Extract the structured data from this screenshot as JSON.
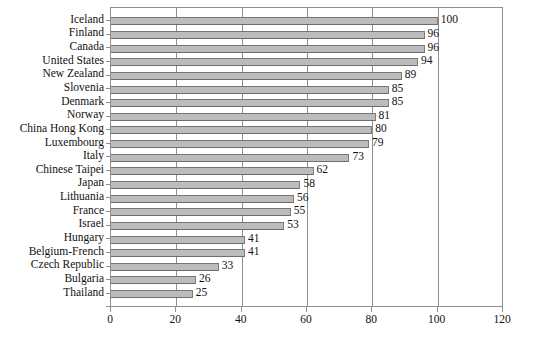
{
  "chart_data": {
    "type": "bar",
    "orientation": "horizontal",
    "title": "",
    "subtitle": "",
    "xlabel": "",
    "ylabel": "",
    "xlim": [
      0,
      120
    ],
    "xticks": [
      0,
      20,
      40,
      60,
      80,
      100,
      120
    ],
    "xtick_labels": [
      "0",
      "20",
      "40",
      "60",
      "80",
      "100",
      "120"
    ],
    "grid": "vertical",
    "legend": null,
    "bar_color": "#bcbcbc",
    "bar_edge_color": "#757575",
    "axis_color": "#8f8f8f",
    "categories": [
      "Iceland",
      "Finland",
      "Canada",
      "United States",
      "New Zealand",
      "Slovenia",
      "Denmark",
      "Norway",
      "China Hong Kong",
      "Luxembourg",
      "Italy",
      "Chinese Taipei",
      "Japan",
      "Lithuania",
      "France",
      "Israel",
      "Hungary",
      "Belgium-French",
      "Czech Republic",
      "Bulgaria",
      "Thailand"
    ],
    "values": [
      100,
      96,
      96,
      94,
      89,
      85,
      85,
      81,
      80,
      79,
      73,
      62,
      58,
      56,
      55,
      53,
      41,
      41,
      33,
      26,
      25
    ],
    "value_labels": [
      "100",
      "96",
      "96",
      "94",
      "89",
      "85",
      "85",
      "81",
      "80",
      "79",
      "73",
      "62",
      "58",
      "56",
      "55",
      "53",
      "41",
      "41",
      "33",
      "26",
      "25"
    ]
  }
}
